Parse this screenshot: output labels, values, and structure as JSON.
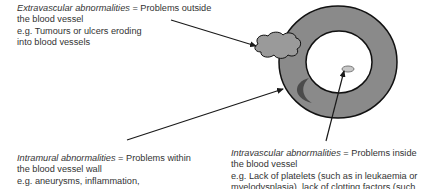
{
  "diagram": {
    "colors": {
      "vessel_wall": "#8a8a8a",
      "vessel_outline": "#111111",
      "lumen": "#ffffff",
      "tumour": "#9a9a9a",
      "aneurysm": "#3f3f3f",
      "clot": "#c8c8c8",
      "arrow": "#1a1a1a",
      "text": "#333333"
    },
    "labels": {
      "extravascular": {
        "term": "Extravascular abnormalities",
        "definition": " = Problems outside",
        "line2": "the blood vessel",
        "line3": "e.g. Tumours or ulcers eroding",
        "line4": "into blood vessels"
      },
      "intramural": {
        "term": "Intramural abnormalities",
        "definition": " = Problems within",
        "line2": "the blood vessel wall",
        "line3": "e.g. aneurysms, inflammation,"
      },
      "intravascular": {
        "term": "Intravascular abnormalities",
        "definition": " = Problems inside",
        "line2": "the blood vessel",
        "line3": "e.g. Lack of platelets (such as in leukaemia or",
        "line4": "myelodysplasia), lack of clotting factors (such"
      }
    }
  }
}
